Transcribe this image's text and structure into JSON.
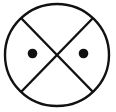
{
  "figure": {
    "canvas": {
      "width": 116,
      "height": 112,
      "background_color": "#ffffff"
    },
    "colors": {
      "stroke": "#111111",
      "dot_fill": "#111111",
      "background": "#ffffff"
    },
    "circle": {
      "label": "outer circle",
      "center_x": 57,
      "center_y": 55,
      "radius_x": 52,
      "radius_y": 51,
      "stroke_width": 2.4
    },
    "cross": {
      "label": "inscribed X",
      "stroke_width": 2.4,
      "lines": [
        {
          "name": "diagonal-top-left-to-bottom-right",
          "x1": 21,
          "y1": 18,
          "x2": 93,
          "y2": 92
        },
        {
          "name": "diagonal-top-right-to-bottom-left",
          "x1": 93,
          "y1": 18,
          "x2": 21,
          "y2": 92
        }
      ],
      "intersection_x": 57,
      "intersection_y": 55
    },
    "dots": [
      {
        "name": "left-dot",
        "center_x": 32.5,
        "center_y": 53.5,
        "radius": 4.8
      },
      {
        "name": "right-dot",
        "center_x": 83.5,
        "center_y": 53.5,
        "radius": 4.8
      }
    ]
  }
}
